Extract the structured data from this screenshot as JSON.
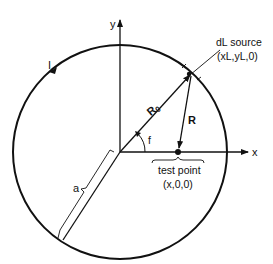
{
  "diagram": {
    "labels": {
      "y_axis": "y",
      "x_axis": "x",
      "current": "I",
      "source_title": "dL source",
      "source_coords": "(xL,yL,0)",
      "r0": "R",
      "r0_sub": "0",
      "r": "R",
      "angle": "f",
      "radius": "a",
      "test_title": "test point",
      "test_coords": "(x,0,0)"
    },
    "colors": {
      "stroke": "#111111",
      "background": "#ffffff"
    }
  }
}
